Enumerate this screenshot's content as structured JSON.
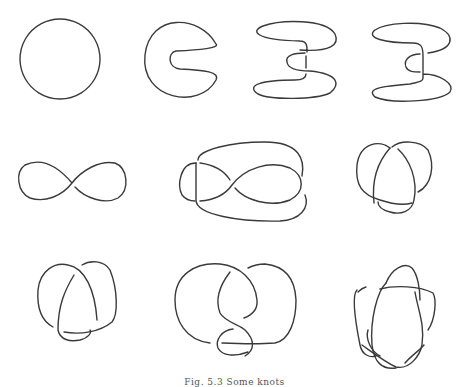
{
  "figure": {
    "caption": "Fig. 5.3  Some knots",
    "stroke_color": "#3a3a3a",
    "knots": [
      {
        "id": "unknot-circle",
        "row": 1,
        "col": 1
      },
      {
        "id": "unknot-c-shape",
        "row": 1,
        "col": 2
      },
      {
        "id": "unknot-twisted-a",
        "row": 1,
        "col": 3
      },
      {
        "id": "unknot-twisted-b",
        "row": 1,
        "col": 4
      },
      {
        "id": "figure-eight-curve",
        "row": 2,
        "col": 1
      },
      {
        "id": "knot-fish",
        "row": 2,
        "col": 2
      },
      {
        "id": "trefoil-a",
        "row": 2,
        "col": 3
      },
      {
        "id": "trefoil-b",
        "row": 3,
        "col": 1
      },
      {
        "id": "figure-eight-knot",
        "row": 3,
        "col": 2
      },
      {
        "id": "pentagram-knot",
        "row": 3,
        "col": 3
      }
    ]
  }
}
